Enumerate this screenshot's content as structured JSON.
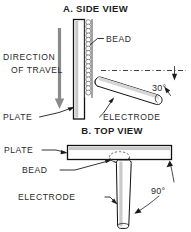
{
  "figure": {
    "panels": [
      {
        "id": "side-view",
        "title": "A. SIDE VIEW",
        "labels": {
          "bead": "BEAD",
          "direction_line1": "DIRECTION",
          "direction_line2": "OF TRAVEL",
          "plate": "PLATE",
          "electrode": "ELECTRODE"
        },
        "angle": "30°"
      },
      {
        "id": "top-view",
        "title": "B. TOP VIEW",
        "labels": {
          "plate": "PLATE",
          "bead": "BEAD",
          "electrode": "ELECTRODE"
        },
        "angle": "90°"
      }
    ]
  },
  "colors": {
    "ink": "#1c1c1c",
    "paper": "#ffffff",
    "shade": "#c9c9c9",
    "shade_dark": "#8e8e8e",
    "arrow_gray": "#8a8a8a"
  }
}
